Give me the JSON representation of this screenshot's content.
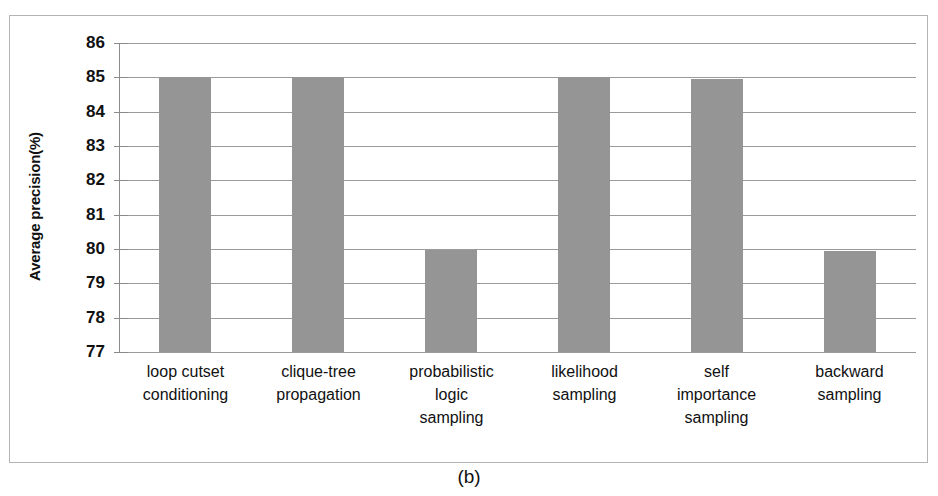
{
  "figure": {
    "caption": "(b)",
    "background_color": "#ffffff",
    "frame_color": "#b4b4b4"
  },
  "chart_data": {
    "type": "bar",
    "title": "",
    "xlabel": "",
    "ylabel": "Average precision(%)",
    "ylim": [
      77,
      86
    ],
    "ytick_step": 1,
    "yticks": [
      86,
      85,
      84,
      83,
      82,
      81,
      80,
      79,
      78,
      77
    ],
    "grid": true,
    "legend": "none",
    "bar_color": "#959595",
    "categories": [
      "loop cutset conditioning",
      "clique-tree propagation",
      "probabilistic logic sampling",
      "likelihood sampling",
      "self importance sampling",
      "backward sampling"
    ],
    "category_lines": [
      [
        "loop cutset",
        "conditioning"
      ],
      [
        "clique-tree",
        "propagation"
      ],
      [
        "probabilistic",
        "logic",
        "sampling"
      ],
      [
        "likelihood",
        "sampling"
      ],
      [
        "self",
        "importance",
        "sampling"
      ],
      [
        "backward",
        "sampling"
      ]
    ],
    "values": [
      85.0,
      85.0,
      79.97,
      85.0,
      84.95,
      79.95
    ]
  }
}
